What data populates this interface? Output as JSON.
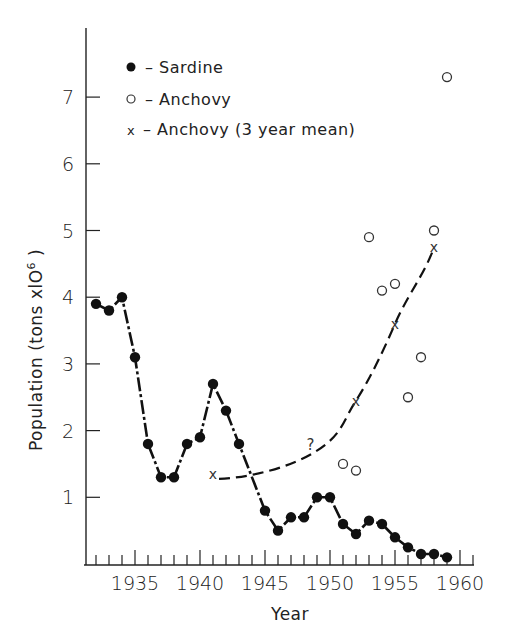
{
  "chart_data": {
    "type": "line",
    "title": "",
    "xlabel": "Year",
    "ylabel": "Population (tons x10^6)",
    "ylabel_display": {
      "main": "Population (tons xlO",
      "sup": "6",
      "close": ")"
    },
    "xlim": [
      1931.5,
      1961
    ],
    "ylim": [
      0,
      8
    ],
    "x_ticks": [
      1935,
      1940,
      1945,
      1950,
      1955,
      1960
    ],
    "x_tick_labels": [
      "1935",
      "1940",
      "1945",
      "1950",
      "1955",
      "1960"
    ],
    "y_ticks": [
      1,
      2,
      3,
      4,
      5,
      6,
      7
    ],
    "y_tick_labels": [
      "1",
      "2",
      "3",
      "4",
      "5",
      "6",
      "7"
    ],
    "grid": false,
    "legend_position": "upper-left",
    "legend": [
      {
        "marker": "filled-circle",
        "label": "– Sardine"
      },
      {
        "marker": "open-circle",
        "label": "– Anchovy"
      },
      {
        "marker": "x",
        "label": "– Anchovy (3 year mean)"
      }
    ],
    "series": [
      {
        "name": "Sardine",
        "marker": "filled-circle",
        "line": "solid-dotted",
        "x": [
          1932,
          1933,
          1934,
          1935,
          1936,
          1937,
          1938,
          1939,
          1940,
          1941,
          1942,
          1943,
          1945,
          1946,
          1947,
          1948,
          1949,
          1950,
          1951,
          1952,
          1953,
          1954,
          1955,
          1956,
          1957,
          1958,
          1959
        ],
        "y": [
          3.9,
          3.8,
          4.0,
          3.1,
          1.8,
          1.3,
          1.3,
          1.8,
          1.9,
          2.7,
          2.3,
          1.8,
          0.8,
          0.5,
          0.7,
          0.7,
          1.0,
          1.0,
          0.6,
          0.45,
          0.65,
          0.6,
          0.4,
          0.25,
          0.15,
          0.15,
          0.1
        ]
      },
      {
        "name": "Anchovy",
        "marker": "open-circle",
        "line": "none",
        "x": [
          1951,
          1952,
          1953,
          1954,
          1955,
          1956,
          1957,
          1958,
          1959
        ],
        "y": [
          1.5,
          1.4,
          4.9,
          4.1,
          4.2,
          2.5,
          3.1,
          5.0,
          7.3
        ]
      },
      {
        "name": "Anchovy (3 year mean)",
        "marker": "x",
        "line": "dashed",
        "x": [
          1941,
          1949,
          1952,
          1955,
          1958
        ],
        "y": [
          1.35,
          1.7,
          2.45,
          3.6,
          4.75
        ]
      }
    ],
    "annotations": [
      {
        "text": "?",
        "x": 1948.5,
        "y": 1.75
      }
    ]
  }
}
